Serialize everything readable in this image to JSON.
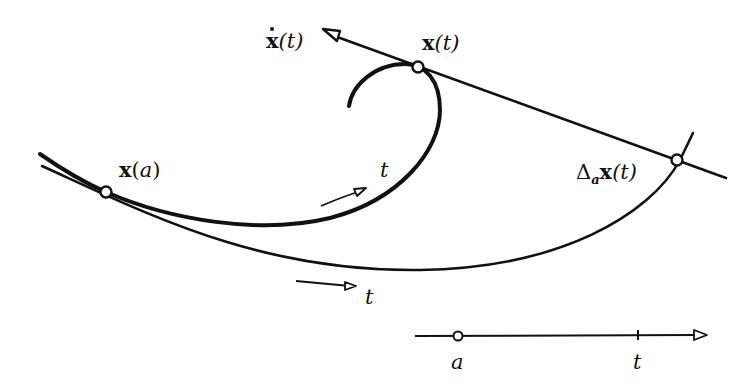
{
  "diagram": {
    "colors": {
      "stroke": "#111111",
      "background": "#ffffff",
      "point_fill": "#ffffff"
    },
    "labels": {
      "velocity": {
        "vec": "x",
        "arg": "(t)",
        "full": "ẋ(t)"
      },
      "point_t": {
        "vec": "x",
        "arg": "(t)",
        "full": "x(t)"
      },
      "point_a": {
        "vec": "x",
        "open": "(",
        "var": "a",
        "close": ")",
        "full": "x(a)"
      },
      "difference": {
        "delta": "Δ",
        "sub": "a",
        "vec": "x",
        "arg": "(t)",
        "full": "Δₐx(t)"
      },
      "direction_upper": "t",
      "direction_lower": "t",
      "axis_a": "a",
      "axis_t": "t"
    },
    "elements": [
      {
        "id": "curve",
        "type": "curve",
        "description": "thick curve x(t) from left through x(a), spiraling up to x(t)"
      },
      {
        "id": "secant-curve",
        "type": "curve",
        "description": "thin curve Δ_a x(t) from x(a) to the tangent line"
      },
      {
        "id": "tangent-line",
        "type": "line",
        "description": "tangent line at x(t) with arrow ẋ(t)"
      },
      {
        "id": "parameter-axis",
        "type": "axis",
        "description": "horizontal parameter axis with points a and t"
      }
    ],
    "points": [
      {
        "name": "x(a)",
        "x": 106,
        "y": 192
      },
      {
        "name": "x(t)",
        "x": 418,
        "y": 67
      },
      {
        "name": "Δ_a x(t)",
        "x": 677,
        "y": 160
      },
      {
        "name": "a",
        "x": 458,
        "y": 336
      },
      {
        "name": "t",
        "x": 638,
        "y": 336
      }
    ]
  }
}
